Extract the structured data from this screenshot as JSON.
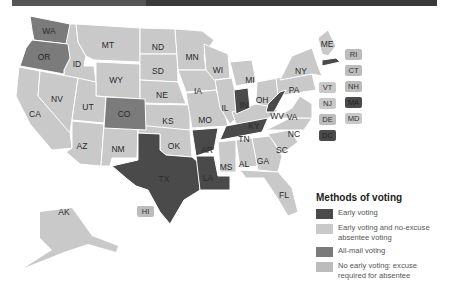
{
  "colors": {
    "early_voting": "#4a4a4a",
    "early_and_no_excuse": "#c9c9c9",
    "all_mail": "#7b7b7b",
    "no_early_excuse": "#bcbcbc",
    "border": "#ffffff",
    "header_bar": "#3a3a3a"
  },
  "legend": {
    "title": "Methods of voting",
    "items": [
      {
        "key": "early_voting",
        "label": "Early voting"
      },
      {
        "key": "early_and_no_excuse",
        "label": "Early voting and no-excuse absentee voting"
      },
      {
        "key": "all_mail",
        "label": "All-mail voting"
      },
      {
        "key": "no_early_excuse",
        "label": "No early voting: excuse required for absentee"
      }
    ]
  },
  "states": {
    "WA": "WA",
    "OR": "OR",
    "ID": "ID",
    "MT": "MT",
    "WY": "WY",
    "CA": "CA",
    "NV": "NV",
    "UT": "UT",
    "CO": "CO",
    "AZ": "AZ",
    "NM": "NM",
    "ND": "ND",
    "SD": "SD",
    "NE": "NE",
    "KS": "KS",
    "OK": "OK",
    "TX": "TX",
    "MN": "MN",
    "IA": "IA",
    "MO": "MO",
    "AR": "AR",
    "LA": "LA",
    "WI": "WI",
    "IL": "IL",
    "MI": "MI",
    "IN": "IN",
    "OH": "OH",
    "KY": "KY",
    "TN": "TN",
    "MS": "MS",
    "AL": "AL",
    "GA": "GA",
    "FL": "FL",
    "SC": "SC",
    "NC": "NC",
    "VA": "VA",
    "WV": "WV",
    "PA": "PA",
    "NY": "NY",
    "ME": "ME",
    "AK": "AK",
    "HI": "HI"
  },
  "small_states": {
    "col1": [
      {
        "abbr": "VT",
        "category": "early_and_no_excuse"
      },
      {
        "abbr": "NJ",
        "category": "early_and_no_excuse"
      },
      {
        "abbr": "DE",
        "category": "no_early_excuse"
      },
      {
        "abbr": "DC",
        "category": "early_voting"
      }
    ],
    "col2": [
      {
        "abbr": "RI",
        "category": "no_early_excuse"
      },
      {
        "abbr": "CT",
        "category": "no_early_excuse"
      },
      {
        "abbr": "NH",
        "category": "no_early_excuse"
      },
      {
        "abbr": "MA",
        "category": "early_voting"
      },
      {
        "abbr": "MD",
        "category": "early_and_no_excuse"
      }
    ]
  }
}
